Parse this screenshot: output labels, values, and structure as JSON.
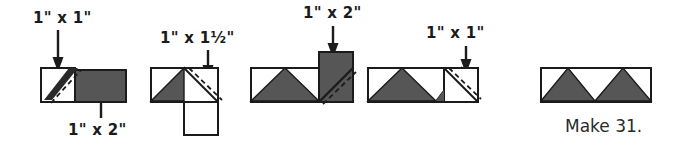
{
  "figure": {
    "colors": {
      "fabric_dark": "#565656",
      "fabric_light": "#ffffff",
      "outline": "#1b1b1b",
      "text": "#1b1b1b",
      "stitch_line": "#1b1b1b"
    },
    "steps": [
      {
        "index": 1,
        "name": "step-1-square-on-rectangle",
        "labels": [
          {
            "name": "label-top-square",
            "text": "1\" x 1\"",
            "points_to": "light square"
          },
          {
            "name": "label-bottom-rectangle",
            "text": "1\" x 2\"",
            "points_to": "dark rectangle"
          }
        ]
      },
      {
        "index": 2,
        "name": "step-2-add-square",
        "labels": [
          {
            "name": "label-top-rectangle",
            "text": "1\" x 1½\"",
            "points_to": "light square flap"
          }
        ]
      },
      {
        "index": 3,
        "name": "step-3-add-dark-rectangle",
        "labels": [
          {
            "name": "label-top-dark-rectangle",
            "text": "1\" x 2\"",
            "points_to": "dark rectangle"
          }
        ]
      },
      {
        "index": 4,
        "name": "step-4-add-final-square",
        "labels": [
          {
            "name": "label-top-final-square",
            "text": "1\" x 1\"",
            "points_to": "light square"
          }
        ]
      },
      {
        "index": 5,
        "name": "step-5-finished-unit",
        "labels": [],
        "caption": "Make 31."
      }
    ]
  }
}
